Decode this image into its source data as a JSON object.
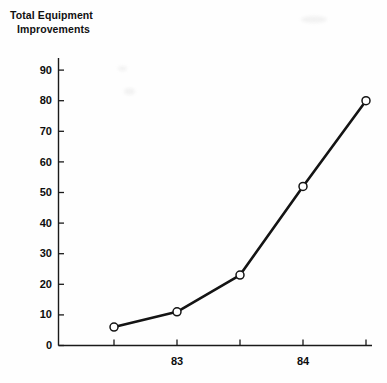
{
  "chart_data": {
    "type": "line",
    "title": "Total Equipment Improvements",
    "title_line1": "Total Equipment",
    "title_line2": "Improvements",
    "xlabel": "",
    "ylabel": "",
    "x": [
      1,
      2,
      3,
      4,
      5
    ],
    "values": [
      6,
      11,
      23,
      52,
      80
    ],
    "categories": [
      "",
      "83",
      "",
      "84",
      ""
    ],
    "xtick_labels": [
      "",
      "83",
      "",
      "84",
      ""
    ],
    "ytick_labels": [
      "0",
      "10",
      "20",
      "30",
      "40",
      "50",
      "60",
      "70",
      "80",
      "90"
    ],
    "ytick_values": [
      0,
      10,
      20,
      30,
      40,
      50,
      60,
      70,
      80,
      90
    ],
    "ylim": [
      0,
      90
    ],
    "grid": false,
    "legend": false,
    "marker": "open-circle",
    "line_color": "#141414",
    "marker_fill": "#ffffff",
    "axis_color": "#1a1a1a",
    "background": "#fefefe",
    "series": [
      {
        "name": "Total Equipment Improvements",
        "values": [
          6,
          11,
          23,
          52,
          80
        ]
      }
    ]
  }
}
